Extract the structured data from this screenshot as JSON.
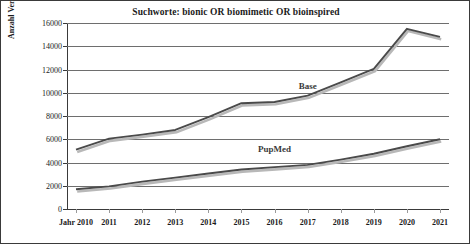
{
  "chart_data": {
    "type": "line",
    "title": "Suchworte: bionic OR biomimetic OR bioinspired",
    "xlabel": "Jahr",
    "ylabel": "Anzahl Veröffentlichungen",
    "categories": [
      "2010",
      "2011",
      "2012",
      "2013",
      "2014",
      "2015",
      "2016",
      "2017",
      "2018",
      "2019",
      "2020",
      "2021"
    ],
    "x_tick_labels": [
      "Jahr 2010",
      "2011",
      "2012",
      "2013",
      "2014",
      "2015",
      "2016",
      "2017",
      "2018",
      "2019",
      "2020",
      "2021"
    ],
    "y_tick_labels": [
      "16000",
      "14000",
      "12000",
      "10000",
      "8000",
      "6000",
      "4000",
      "2000",
      "0"
    ],
    "y_ticks": [
      16000,
      14000,
      12000,
      10000,
      8000,
      6000,
      4000,
      2000,
      0
    ],
    "ylim": [
      0,
      16000
    ],
    "grid": true,
    "legend": "inline-labels",
    "series": [
      {
        "name": "Base",
        "color": "#4a4a4a",
        "shadow_color": "#b8b8b8",
        "label_x_category": "2017",
        "label_value": 10600,
        "values": [
          5100,
          6050,
          6400,
          6800,
          7900,
          9100,
          9200,
          9750,
          10900,
          12050,
          15500,
          14800
        ]
      },
      {
        "name": "PupMed",
        "color": "#4a4a4a",
        "shadow_color": "#b8b8b8",
        "label_x_category": "2016",
        "label_value": 5150,
        "values": [
          1700,
          1950,
          2350,
          2700,
          3050,
          3400,
          3600,
          3800,
          4250,
          4750,
          5400,
          6000
        ]
      }
    ]
  },
  "colors": {
    "frame_border": "#3a3a3a",
    "background": "#ffffff",
    "gridline": "#6e6e6e",
    "axis": "#3a3a3a",
    "text": "#1a1a1a"
  }
}
